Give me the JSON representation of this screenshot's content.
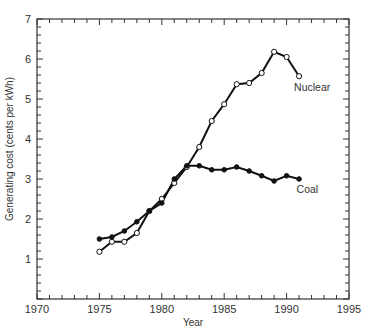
{
  "chart_data": {
    "type": "line",
    "title": "",
    "xlabel": "Year",
    "ylabel": "Generating cost (cents per kWh)",
    "xlim": [
      1970,
      1995
    ],
    "ylim": [
      0,
      7
    ],
    "x_ticks": [
      1970,
      1975,
      1980,
      1985,
      1990,
      1995
    ],
    "y_ticks": [
      1,
      2,
      3,
      4,
      5,
      6,
      7
    ],
    "grid": false,
    "legend": "inline labels",
    "x": [
      1975,
      1976,
      1977,
      1978,
      1979,
      1980,
      1981,
      1982,
      1983,
      1984,
      1985,
      1986,
      1987,
      1988,
      1989,
      1990,
      1991
    ],
    "series": [
      {
        "name": "Nuclear",
        "marker": "open-circle",
        "values": [
          1.18,
          1.43,
          1.43,
          1.65,
          2.2,
          2.5,
          2.9,
          3.3,
          3.8,
          4.45,
          4.87,
          5.37,
          5.4,
          5.65,
          6.18,
          6.05,
          5.57
        ]
      },
      {
        "name": "Coal",
        "marker": "filled-circle",
        "values": [
          1.5,
          1.55,
          1.7,
          1.93,
          2.2,
          2.4,
          3.0,
          3.33,
          3.33,
          3.23,
          3.23,
          3.3,
          3.2,
          3.08,
          2.95,
          3.08,
          3.0
        ]
      }
    ],
    "annotations": [
      {
        "text": "Nuclear",
        "x": 1990.6,
        "y": 5.3
      },
      {
        "text": "Coal",
        "x": 1990.8,
        "y": 2.75
      }
    ]
  }
}
